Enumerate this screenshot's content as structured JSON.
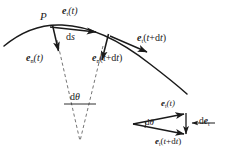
{
  "figure": {
    "type": "geometry-diagram",
    "background_color": "#ffffff",
    "stroke_color": "#1a1a1a",
    "dashed_color": "#555555"
  },
  "labels": {
    "point_p": "P",
    "arc_length": "ds",
    "angle": "dθ",
    "inset_angle": "dθ",
    "tangent_t": {
      "vec": "e",
      "sub": "t",
      "arg": "(t)"
    },
    "tangent_tdt": {
      "vec": "e",
      "sub": "t",
      "arg": "(t+dt)"
    },
    "normal_t": {
      "vec": "e",
      "sub": "n",
      "arg": "(t)"
    },
    "normal_tdt": {
      "vec": "e",
      "sub": "n",
      "arg": "(t+dt)"
    },
    "inset_tangent_t": {
      "vec": "e",
      "sub": "t",
      "arg": "(t)"
    },
    "inset_tangent_tdt": {
      "vec": "e",
      "sub": "t",
      "arg": "(t+dt)"
    },
    "delta_tangent": {
      "pre": "d",
      "vec": "e",
      "sub": "t"
    }
  },
  "text": {
    "point_p": "P",
    "arc_length_d": "d",
    "arc_length_s": "s",
    "angle_d": "d",
    "angle_theta": "θ",
    "e": "e",
    "sub_t": "t",
    "sub_n": "n",
    "arg_t": "(t)",
    "arg_tdt_open": "(",
    "arg_tdt_t": "t",
    "arg_tdt_plus": "+",
    "arg_tdt_d": "d",
    "arg_tdt_t2": "t",
    "arg_tdt_close": ")",
    "d_prefix": "d"
  },
  "geometry": {
    "curve_description": "Concave-down arc sweeping from lower-left up through point P and down to the lower-right",
    "center_of_curvature": [
      80,
      140
    ],
    "point_p": [
      52,
      28
    ],
    "point_q": [
      110,
      37
    ],
    "dtheta_chord": [
      [
        64,
        103
      ],
      [
        95,
        103
      ]
    ],
    "inset_apex": [
      133,
      124
    ]
  }
}
